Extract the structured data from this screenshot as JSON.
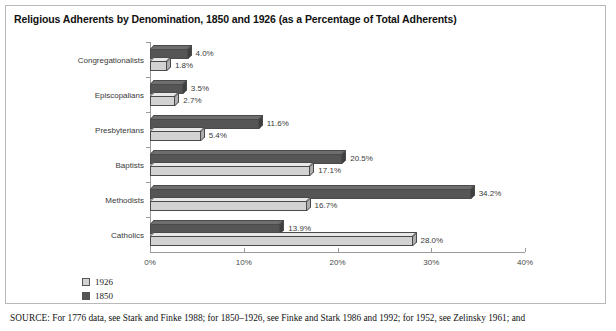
{
  "figure": {
    "title": "Religious Adherents by Denomination, 1850 and 1926 (as a Percentage of Total Adherents)",
    "source_prefix": "SOURCE:",
    "source_text": " For 1776 data, see Stark and Finke 1988; for 1850–1926, see Finke and Stark 1986 and 1992; for 1952, see Zelinsky 1961; and"
  },
  "chart_data": {
    "type": "bar",
    "orientation": "horizontal",
    "title": "Religious Adherents by Denomination, 1850 and 1926 (as a Percentage of Total Adherents)",
    "xlabel": "",
    "ylabel": "",
    "xlim": [
      0,
      40
    ],
    "xticks": [
      0,
      10,
      20,
      30,
      40
    ],
    "xticklabels": [
      "0%",
      "10%",
      "20%",
      "30%",
      "40%"
    ],
    "grid": false,
    "legend_position": "bottom-left",
    "categories": [
      "Congregationalists",
      "Episcopalians",
      "Presbyterians",
      "Baptists",
      "Methodists",
      "Catholics"
    ],
    "series": [
      {
        "name": "1850",
        "color": "#555555",
        "values": [
          4.0,
          3.5,
          11.6,
          20.5,
          34.2,
          13.9
        ],
        "labels": [
          "4.0%",
          "3.5%",
          "11.6%",
          "20.5%",
          "34.2%",
          "13.9%"
        ]
      },
      {
        "name": "1926",
        "color": "#d2d2d2",
        "values": [
          1.8,
          2.7,
          5.4,
          17.1,
          16.7,
          28.0
        ],
        "labels": [
          "1.8%",
          "2.7%",
          "5.4%",
          "17.1%",
          "16.7%",
          "28.0%"
        ]
      }
    ],
    "legend": [
      {
        "label": "1926",
        "color": "#d2d2d2"
      },
      {
        "label": "1850",
        "color": "#555555"
      }
    ]
  }
}
